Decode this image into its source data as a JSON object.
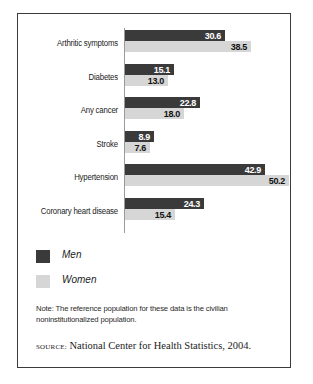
{
  "chart_data": {
    "type": "bar",
    "orientation": "horizontal",
    "title": "",
    "xlabel": "",
    "ylabel": "",
    "xlim": [
      0,
      52
    ],
    "grid": false,
    "legend_position": "below-left",
    "categories": [
      "Arthritic symptoms",
      "Diabetes",
      "Any cancer",
      "Stroke",
      "Hypertension",
      "Coronary heart disease"
    ],
    "series": [
      {
        "name": "Men",
        "color": "#3a3a3a",
        "values": [
          30.6,
          15.1,
          22.8,
          8.9,
          42.9,
          24.3
        ]
      },
      {
        "name": "Women",
        "color": "#d6d6d6",
        "values": [
          38.5,
          13.0,
          18.0,
          7.6,
          50.2,
          15.4
        ]
      }
    ],
    "value_labels": [
      [
        "30.6",
        "38.5"
      ],
      [
        "15.1",
        "13.0"
      ],
      [
        "22.8",
        "18.0"
      ],
      [
        "8.9",
        "7.6"
      ],
      [
        "42.9",
        "50.2"
      ],
      [
        "24.3",
        "15.4"
      ]
    ]
  },
  "legend": {
    "items": [
      {
        "label": "Men",
        "color": "#3a3a3a"
      },
      {
        "label": "Women",
        "color": "#d6d6d6"
      }
    ]
  },
  "note": {
    "text": "Note: The reference population for these data is the civilian noninstitutionalized population."
  },
  "source": {
    "kicker": "source:",
    "text": "National Center for Health Statistics, 2004."
  }
}
